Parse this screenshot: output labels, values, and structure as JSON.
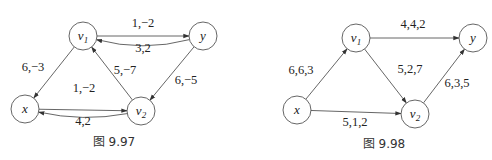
{
  "figures": [
    {
      "caption": "图 9.97",
      "nodes": [
        {
          "id": "v1",
          "label": "v",
          "sub": "1"
        },
        {
          "id": "y",
          "label": "y",
          "sub": ""
        },
        {
          "id": "x",
          "label": "x",
          "sub": ""
        },
        {
          "id": "v2",
          "label": "v",
          "sub": "2"
        }
      ],
      "edges": [
        {
          "from": "y",
          "to": "v1",
          "label": "1,−2",
          "curved": true
        },
        {
          "from": "v1",
          "to": "y",
          "label": "3,2",
          "curved": false
        },
        {
          "from": "v1",
          "to": "x",
          "label": "6,−3",
          "curved": false
        },
        {
          "from": "v2",
          "to": "v1",
          "label": "5,−7",
          "curved": false
        },
        {
          "from": "y",
          "to": "v2",
          "label": "6,−5",
          "curved": false
        },
        {
          "from": "v2",
          "to": "x",
          "label": "1,−2",
          "curved": true
        },
        {
          "from": "x",
          "to": "v2",
          "label": "4,2",
          "curved": false
        }
      ]
    },
    {
      "caption": "图 9.98",
      "nodes": [
        {
          "id": "v1",
          "label": "v",
          "sub": "1"
        },
        {
          "id": "y",
          "label": "y",
          "sub": ""
        },
        {
          "id": "x",
          "label": "x",
          "sub": ""
        },
        {
          "id": "v2",
          "label": "v",
          "sub": "2"
        }
      ],
      "edges": [
        {
          "from": "v1",
          "to": "y",
          "label": "4,4,2",
          "curved": false
        },
        {
          "from": "x",
          "to": "v1",
          "label": "6,6,3",
          "curved": false
        },
        {
          "from": "v1",
          "to": "v2",
          "label": "5,2,7",
          "curved": false
        },
        {
          "from": "v2",
          "to": "y",
          "label": "6,3,5",
          "curved": false
        },
        {
          "from": "x",
          "to": "v2",
          "label": "5,1,2",
          "curved": false
        }
      ]
    }
  ]
}
